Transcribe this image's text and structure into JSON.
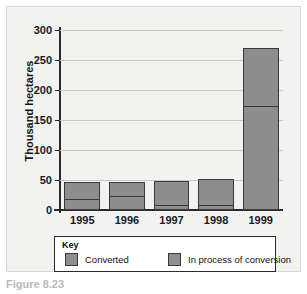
{
  "figure": {
    "caption": "Figure 8.23"
  },
  "legend": {
    "title": "Key",
    "items": [
      {
        "label": "Converted",
        "color": "#8d8d8d"
      },
      {
        "label": "In process of conversion",
        "color": "#8d8d8d"
      }
    ]
  },
  "chart_data": {
    "type": "bar",
    "stacked": true,
    "title": "",
    "xlabel": "",
    "ylabel": "Thousand hectares",
    "categories": [
      "1995",
      "1996",
      "1997",
      "1998",
      "1999"
    ],
    "series": [
      {
        "name": "Converted",
        "values": [
          17,
          22,
          7,
          6,
          172
        ]
      },
      {
        "name": "In process of conversion",
        "values": [
          29,
          25,
          41,
          45,
          98
        ]
      }
    ],
    "totals": [
      46,
      47,
      48,
      51,
      270
    ],
    "ylim": [
      0,
      300
    ],
    "yticks": [
      0,
      50,
      100,
      150,
      200,
      250,
      300
    ],
    "ytick_labels": [
      "0",
      "50",
      "100",
      "150",
      "200",
      "250",
      "300"
    ],
    "grid": true,
    "legend_position": "bottom",
    "bar_color": "#8d8d8d",
    "bar_edge_color": "#3a3a3a",
    "background": "#f2f2f0"
  }
}
